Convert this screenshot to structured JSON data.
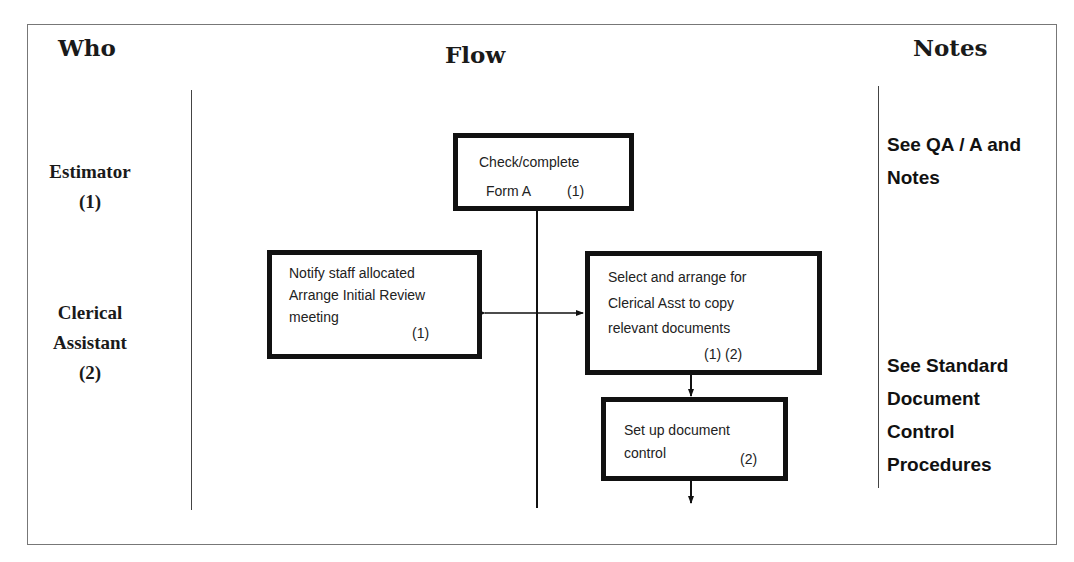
{
  "headers": {
    "who": "Who",
    "flow": "Flow",
    "notes": "Notes"
  },
  "roles": [
    {
      "name": "Estimator",
      "code": "(1)"
    },
    {
      "name_line1": "Clerical",
      "name_line2": "Assistant",
      "code": "(2)"
    }
  ],
  "flow": {
    "check_form": {
      "line1": "Check/complete",
      "line2": "Form A",
      "who": "(1)"
    },
    "notify_staff": {
      "line1": "Notify staff allocated",
      "line2": "Arrange Initial Review",
      "line3": "meeting",
      "who": "(1)"
    },
    "select_arrange": {
      "line1": "Select and arrange for",
      "line2": "Clerical Asst to copy",
      "line3": "relevant documents",
      "who": "(1) (2)"
    },
    "doc_control": {
      "line1": "Set up document",
      "line2": "control",
      "who": "(2)"
    }
  },
  "notes": {
    "qa": {
      "line1": "See QA / A and",
      "line2": "Notes"
    },
    "standard": {
      "line1": "See Standard",
      "line2": "Document",
      "line3": "Control",
      "line4": "Procedures"
    }
  },
  "colors": {
    "line": "#111111",
    "border": "#777777"
  }
}
